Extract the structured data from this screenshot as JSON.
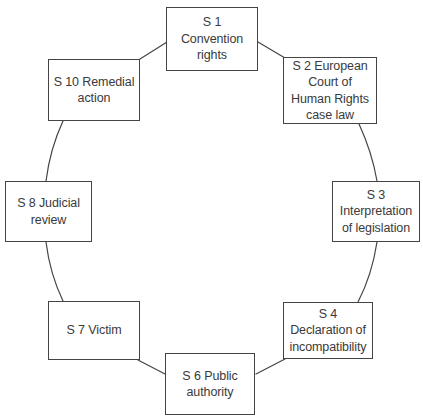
{
  "diagram": {
    "type": "cycle-diagram",
    "style": {
      "background": "#ffffff",
      "node_fill": "#ffffff",
      "node_stroke": "#444444",
      "connector_stroke": "#444444",
      "text_color": "#3a3a3a"
    },
    "nodes": [
      {
        "id": "s1",
        "label": "S 1 Convention\nrights",
        "x": 166,
        "y": 7,
        "w": 92,
        "h": 64
      },
      {
        "id": "s2",
        "label": "S 2 European\nCourt of\nHuman Rights\ncase law",
        "x": 283,
        "y": 57,
        "w": 94,
        "h": 67
      },
      {
        "id": "s3",
        "label": "S 3\nInterpretation\nof legislation",
        "x": 332,
        "y": 181,
        "w": 88,
        "h": 61
      },
      {
        "id": "s4",
        "label": "S 4\nDeclaration of\nincompatibility",
        "x": 283,
        "y": 302,
        "w": 90,
        "h": 57
      },
      {
        "id": "s6",
        "label": "S 6 Public\nauthority",
        "x": 165,
        "y": 353,
        "w": 90,
        "h": 62
      },
      {
        "id": "s7",
        "label": "S 7 Victim",
        "x": 48,
        "y": 301,
        "w": 92,
        "h": 59
      },
      {
        "id": "s8",
        "label": "S 8 Judicial\nreview",
        "x": 5,
        "y": 181,
        "w": 87,
        "h": 61
      },
      {
        "id": "s10",
        "label": "S 10 Remedial\naction",
        "x": 48,
        "y": 59,
        "w": 92,
        "h": 62
      }
    ],
    "connectors": [
      {
        "id": "c-s1-s2",
        "from": "s1",
        "to": "s2",
        "path": "M 258 42 L 285 58"
      },
      {
        "id": "c-s2-s3",
        "from": "s2",
        "to": "s3",
        "path": "M 359 124 Q 372 152 377 181"
      },
      {
        "id": "c-s3-s4",
        "from": "s3",
        "to": "s4",
        "path": "M 377 242 Q 372 275 358 302"
      },
      {
        "id": "c-s4-s6",
        "from": "s4",
        "to": "s6",
        "path": "M 285 359 L 256 374"
      },
      {
        "id": "c-s6-s7",
        "from": "s6",
        "to": "s7",
        "path": "M 165 374 L 138 360"
      },
      {
        "id": "c-s7-s8",
        "from": "s7",
        "to": "s8",
        "path": "M 63 301 Q 50 274 46 242"
      },
      {
        "id": "c-s8-s10",
        "from": "s8",
        "to": "s10",
        "path": "M 46 181 Q 50 149 63 121"
      },
      {
        "id": "c-s10-s1",
        "from": "s10",
        "to": "s1",
        "path": "M 140 59 L 167 42"
      }
    ]
  }
}
